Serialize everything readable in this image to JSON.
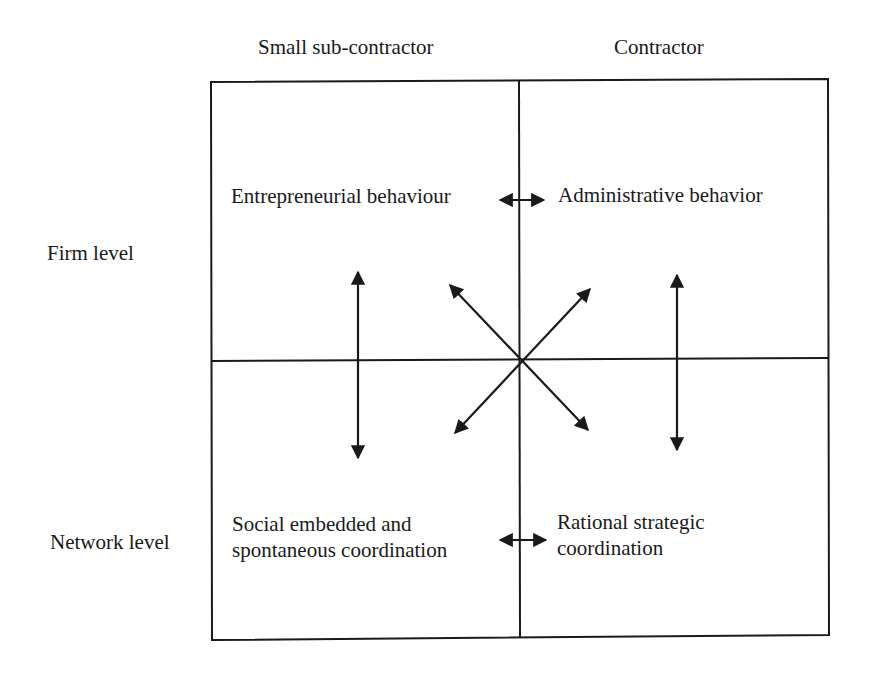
{
  "columns": [
    {
      "label": "Small sub-contractor"
    },
    {
      "label": "Contractor"
    }
  ],
  "rows": [
    {
      "label": "Firm level"
    },
    {
      "label": "Network level"
    }
  ],
  "cells": {
    "top_left": {
      "line1": "Entrepreneurial behaviour"
    },
    "top_right": {
      "line1": "Administrative behavior"
    },
    "bottom_left": {
      "line1": "Social embedded and",
      "line2": "spontaneous coordination"
    },
    "bottom_right": {
      "line1": "Rational strategic",
      "line2": "coordination"
    }
  },
  "arrows": [
    "top-left <-> top-right (horizontal)",
    "bottom-left <-> bottom-right (horizontal)",
    "top-left <-> bottom-left (vertical)",
    "top-right <-> bottom-right (vertical)",
    "top-left <-> bottom-right (diagonal)",
    "top-right <-> bottom-left (diagonal)"
  ],
  "colors": {
    "line": "#1a1a1a",
    "background": "#ffffff"
  }
}
